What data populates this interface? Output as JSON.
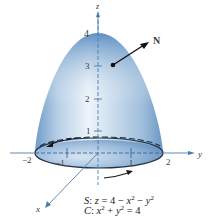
{
  "figure": {
    "type": "3d-surface-diagram",
    "surface_label": "S",
    "surface_equation": "z = 4 − x² − y²",
    "curve_label": "C",
    "curve_equation": "x² + y² = 4",
    "normal_vector_label": "N",
    "axes": {
      "z": {
        "label": "z",
        "ticks": [
          "1",
          "2",
          "3",
          "4"
        ]
      },
      "y": {
        "label": "y",
        "ticks": [
          "−2",
          "−1",
          "1",
          "2"
        ]
      },
      "x": {
        "label": "x"
      }
    },
    "orientation": "counterclockwise boundary arrows",
    "colors": {
      "surface_light": "#e8f0f8",
      "surface_mid": "#a9c3de",
      "surface_dark": "#5f8fbf",
      "axis": "#4a7fb0",
      "arrow": "#1a1a1a"
    }
  },
  "labels": {
    "z": "z",
    "y": "y",
    "x": "x",
    "N": "N",
    "tick_z4": "4",
    "tick_z3": "3",
    "tick_z2": "2",
    "tick_z1": "1",
    "tick_yneg2": "−2",
    "tick_yneg1": "−1",
    "tick_y1": "1",
    "tick_y2": "2"
  },
  "caption": {
    "line1_name": "S",
    "line1_sep": ": ",
    "line1_var": "z",
    "line1_rest": " = 4 − ",
    "line1_x": "x",
    "line1_x_exp": "2",
    "line1_minus": " − ",
    "line1_y": "y",
    "line1_y_exp": "2",
    "line2_name": "C",
    "line2_sep": ": ",
    "line2_x": "x",
    "line2_x_exp": "2",
    "line2_plus": " + ",
    "line2_y": "y",
    "line2_y_exp": "2",
    "line2_rest": " = 4"
  }
}
